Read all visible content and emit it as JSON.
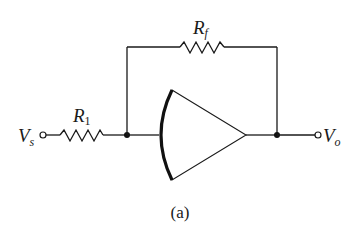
{
  "diagram": {
    "type": "inverting-amplifier-circuit",
    "caption": "(a)",
    "components": {
      "input": {
        "symbol": "V",
        "subscript": "s"
      },
      "output": {
        "symbol": "V",
        "subscript": "o"
      },
      "input_resistor": {
        "symbol": "R",
        "subscript": "1"
      },
      "feedback_resistor": {
        "symbol": "R",
        "subscript": "f"
      },
      "amplifier": {
        "shape": "curved-back triangle"
      }
    },
    "colors": {
      "line": "#1a1a1a",
      "background": "#ffffff"
    }
  }
}
